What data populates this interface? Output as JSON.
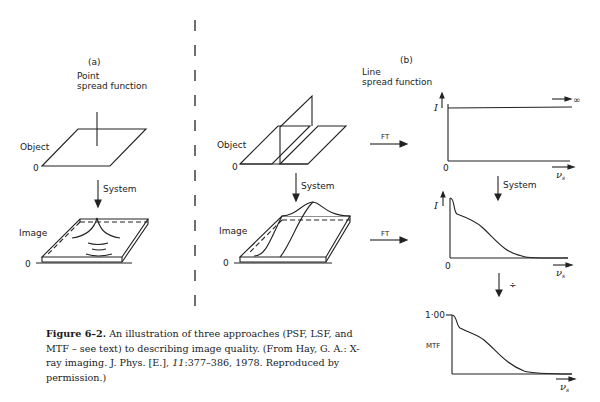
{
  "panel_a": {
    "label": "(a)",
    "title_line1": "Point",
    "title_line2": "spread function",
    "object_label": "Object",
    "image_label": "Image",
    "origin_object": "0",
    "origin_image": "0",
    "system_label": "System"
  },
  "panel_b": {
    "label": "(b)",
    "title_line1": "Line",
    "title_line2": "spread function",
    "object_label": "Object",
    "image_label": "Image",
    "origin_object": "0",
    "origin_image": "0",
    "system_label": "System",
    "ft_label_top": "FT",
    "ft_label_bottom": "FT"
  },
  "plots": {
    "top": {
      "y_label": "I",
      "origin": "0",
      "x_label": "ν",
      "x_sub": "s",
      "infinity": "∞"
    },
    "middle": {
      "y_label": "I",
      "origin": "0",
      "x_label": "ν",
      "x_sub": "s"
    },
    "system_label": "System",
    "divide_symbol": "÷",
    "bottom": {
      "y_tick": "1·00",
      "y_label": "MTF",
      "x_label": "ν",
      "x_sub": "s"
    }
  },
  "caption": {
    "figure_label": "Figure 6–2.",
    "text_1": " An illustration of three approaches (PSF, LSF, and MTF – see text) to describing image quality. (From Hay, G. A.: X-ray imaging. J. Phys. [E.], ",
    "volume": "11",
    "text_2": ":377–386, 1978. Reproduced by permission.)"
  }
}
